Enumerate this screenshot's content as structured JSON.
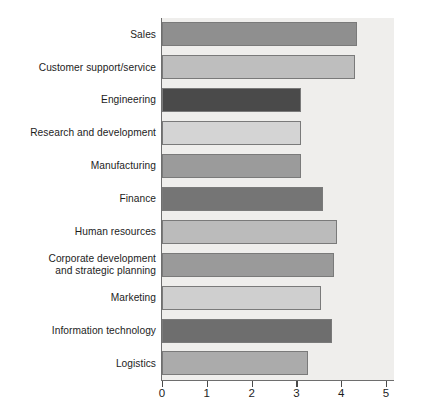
{
  "chart_data": {
    "type": "bar",
    "orientation": "horizontal",
    "title": "",
    "subtitle": "",
    "xlabel": "",
    "ylabel": "",
    "xlim": [
      0,
      5
    ],
    "ylim": null,
    "grid": false,
    "legend": false,
    "legend_position": "none",
    "xticks": [
      "0",
      "1",
      "2",
      "3",
      "4",
      "5"
    ],
    "xtick_values": [
      0,
      1,
      2,
      3,
      4,
      5
    ],
    "categories": [
      "Sales",
      "Customer support/service",
      "Engineering",
      "Research and development",
      "Manufacturing",
      "Finance",
      "Human resources",
      "Corporate development\nand strategic planning",
      "Marketing",
      "Information technology",
      "Logistics"
    ],
    "values": [
      4.35,
      4.3,
      3.1,
      3.1,
      3.1,
      3.6,
      3.9,
      3.85,
      3.55,
      3.8,
      3.25
    ],
    "bar_colors": [
      "#8f8f8f",
      "#bebebe",
      "#4a4a4a",
      "#d4d4d4",
      "#9b9b9b",
      "#757575",
      "#bbbbbb",
      "#9a9a9a",
      "#cfcfcf",
      "#6e6e6e",
      "#ababab"
    ],
    "bar_edge_color": "#7a7a7a",
    "plot_background": "#efeeec",
    "axis_color": "#6e6e6e",
    "text_color": "#1d1d1d"
  }
}
